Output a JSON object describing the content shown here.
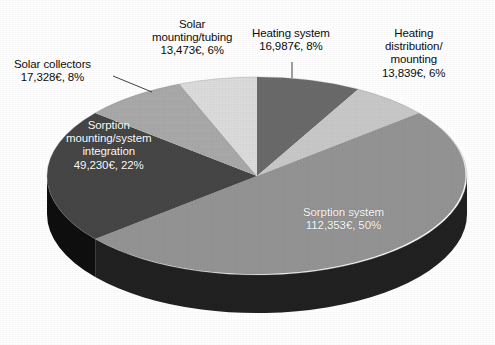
{
  "chart_data": {
    "type": "pie",
    "title": "",
    "subtitle": "",
    "xlabel": "",
    "ylabel": "",
    "currency": "€",
    "legend_position": "none",
    "grid": false,
    "three_d": true,
    "total_value": 223210,
    "categories": [
      "Sorption system",
      "Sorption mounting/system integration",
      "Solar collectors",
      "Solar mounting/tubing",
      "Heating system",
      "Heating distribution/mounting"
    ],
    "values": [
      112353,
      49230,
      17328,
      13473,
      16987,
      13839
    ],
    "percentages": [
      50,
      22,
      8,
      6,
      8,
      6
    ],
    "value_labels": [
      "112,353€",
      "49,230€",
      "17,328€",
      "13,473€",
      "16,987€",
      "13,839€"
    ],
    "percent_labels": [
      "50%",
      "22%",
      "8%",
      "6%",
      "8%",
      "6%"
    ],
    "colors": [
      "#949494",
      "#464646",
      "#a9a9a9",
      "#dcdcdc",
      "#6a6a6a",
      "#c8c8c8"
    ],
    "slices": [
      {
        "name": "Sorption system",
        "value": 112353,
        "percent": 50,
        "value_label": "112,353€",
        "percent_label": "50%",
        "color": "#949494",
        "label_placement": "inside"
      },
      {
        "name": "Sorption mounting/system integration",
        "value": 49230,
        "percent": 22,
        "value_label": "49,230€",
        "percent_label": "22%",
        "color": "#464646",
        "label_placement": "inside"
      },
      {
        "name": "Solar collectors",
        "value": 17328,
        "percent": 8,
        "value_label": "17,328€",
        "percent_label": "8%",
        "color": "#a9a9a9",
        "label_placement": "outside"
      },
      {
        "name": "Solar mounting/tubing",
        "value": 13473,
        "percent": 6,
        "value_label": "13,473€",
        "percent_label": "6%",
        "color": "#dcdcdc",
        "label_placement": "outside"
      },
      {
        "name": "Heating system",
        "value": 16987,
        "percent": 8,
        "value_label": "16,987€",
        "percent_label": "8%",
        "color": "#6a6a6a",
        "label_placement": "outside"
      },
      {
        "name": "Heating distribution/mounting",
        "value": 13839,
        "percent": 6,
        "value_label": "13,839€",
        "percent_label": "6%",
        "color": "#c8c8c8",
        "label_placement": "outside"
      }
    ]
  },
  "labels": {
    "solar_collectors": {
      "line1": "Solar collectors",
      "line2": "17,328€, 8%"
    },
    "solar_mounting": {
      "line1": "Solar",
      "line2": "mounting/tubing",
      "line3": "13,473€, 6%"
    },
    "heating_system": {
      "line1": "Heating system",
      "line2": "16,987€, 8%"
    },
    "heating_distribution": {
      "line1": "Heating",
      "line2": "distribution/",
      "line3": "mounting",
      "line4": "13,839€, 6%"
    },
    "sorption_mounting": {
      "line1": "Sorption",
      "line2": "mounting/system",
      "line3": "integration",
      "line4": "49,230€, 22%"
    },
    "sorption_system": {
      "line1": "Sorption system",
      "line2": "112,353€, 50%"
    }
  }
}
